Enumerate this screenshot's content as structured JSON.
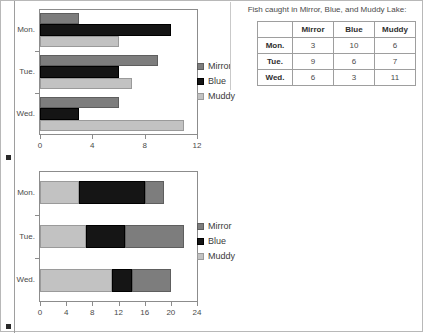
{
  "page": {
    "left_rule": true
  },
  "table_panel": {
    "title": "Fish caught in Mirror, Blue, and Muddy Lake:",
    "corner_label": "",
    "columns": [
      "Mirror",
      "Blue",
      "Muddy"
    ],
    "rows": [
      {
        "label": "Mon.",
        "values": [
          3,
          10,
          6
        ]
      },
      {
        "label": "Tue.",
        "values": [
          9,
          6,
          7
        ]
      },
      {
        "label": "Wed.",
        "values": [
          6,
          3,
          11
        ]
      }
    ]
  },
  "legend": {
    "entries": [
      {
        "label": "Mirror",
        "color": "#7d7d7d",
        "key_name": "legend-key-mirror"
      },
      {
        "label": "Blue",
        "color": "#151515",
        "key_name": "legend-key-blue"
      },
      {
        "label": "Muddy",
        "color": "#c2c2c2",
        "key_name": "legend-key-muddy"
      }
    ]
  },
  "chart_data": [
    {
      "type": "bar",
      "id": "grouped-bar-chart",
      "orientation": "horizontal",
      "stacked": false,
      "title": "",
      "xlabel": "",
      "ylabel": "",
      "categories": [
        "Mon.",
        "Tue.",
        "Wed."
      ],
      "series": [
        {
          "name": "Mirror",
          "color": "#7d7d7d",
          "values": [
            3,
            9,
            6
          ]
        },
        {
          "name": "Blue",
          "color": "#151515",
          "values": [
            10,
            6,
            3
          ]
        },
        {
          "name": "Muddy",
          "color": "#c2c2c2",
          "values": [
            6,
            7,
            11
          ]
        }
      ],
      "xlim": [
        0,
        12
      ],
      "xticks": [
        0,
        4,
        8,
        12
      ],
      "grid": false,
      "legend_position": "right"
    },
    {
      "type": "bar",
      "id": "stacked-bar-chart",
      "orientation": "horizontal",
      "stacked": true,
      "title": "",
      "xlabel": "",
      "ylabel": "",
      "categories": [
        "Mon.",
        "Tue.",
        "Wed."
      ],
      "stack_order": [
        "Muddy",
        "Blue",
        "Mirror"
      ],
      "series": [
        {
          "name": "Muddy",
          "color": "#c2c2c2",
          "values": [
            6,
            7,
            11
          ]
        },
        {
          "name": "Blue",
          "color": "#151515",
          "values": [
            10,
            6,
            3
          ]
        },
        {
          "name": "Mirror",
          "color": "#7d7d7d",
          "values": [
            3,
            9,
            6
          ]
        }
      ],
      "totals": [
        19,
        22,
        20
      ],
      "xlim": [
        0,
        24
      ],
      "xticks": [
        0,
        4,
        8,
        12,
        16,
        20,
        24
      ],
      "grid": false,
      "legend_position": "right"
    }
  ]
}
